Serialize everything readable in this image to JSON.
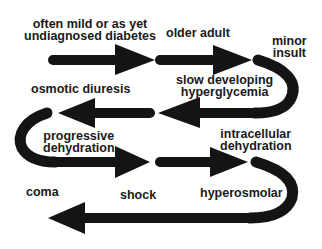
{
  "diagram": {
    "type": "flow-serpentine",
    "colors": {
      "arrow": "#141414",
      "text": "#1a1a1a",
      "background": "#ffffff"
    },
    "labels": {
      "l1": "often mild or as yet",
      "l1b": "undiagnosed diabetes",
      "l2": "older adult",
      "l3": "minor",
      "l3b": "insult",
      "l4": "slow developing",
      "l4b": "hyperglycemia",
      "l5": "osmotic diuresis",
      "l6": "progressive",
      "l6b": "dehydration",
      "l7": "intracellular",
      "l7b": "dehydration",
      "l8": "shock",
      "l9": "hyperosmolar",
      "l10": "coma"
    },
    "sequence": [
      "often mild or as yet undiagnosed diabetes",
      "older adult",
      "minor insult",
      "slow developing hyperglycemia",
      "osmotic diuresis",
      "progressive dehydration",
      "intracellular dehydration",
      "hyperosmolar",
      "shock",
      "coma"
    ]
  }
}
